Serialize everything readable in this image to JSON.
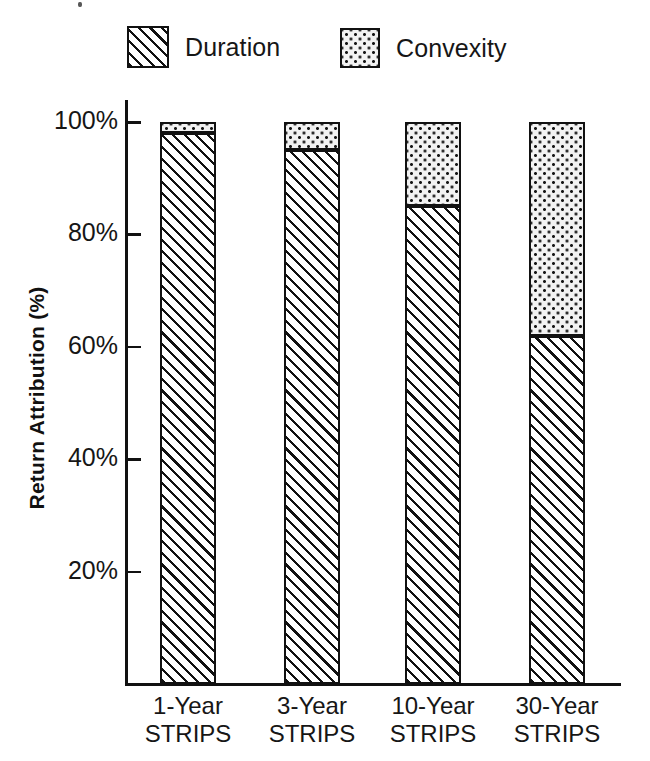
{
  "chart_data": {
    "type": "bar",
    "subtype": "stacked-bar-100",
    "title": "",
    "xlabel": "",
    "ylabel": "Return Attribution (%)",
    "ylim": [
      0,
      105
    ],
    "grid": false,
    "legend_position": "top",
    "categories": [
      "1-Year\nSTRIPS",
      "3-Year\nSTRIPS",
      "10-Year\nSTRIPS",
      "30-Year\nSTRIPS"
    ],
    "category_lines": [
      {
        "line1": "1-Year",
        "line2": "STRIPS"
      },
      {
        "line1": "3-Year",
        "line2": "STRIPS"
      },
      {
        "line1": "10-Year",
        "line2": "STRIPS"
      },
      {
        "line1": "30-Year",
        "line2": "STRIPS"
      }
    ],
    "series": [
      {
        "name": "Duration",
        "pattern": "diagonal-hatch",
        "values": [
          98,
          95,
          85,
          62
        ]
      },
      {
        "name": "Convexity",
        "pattern": "dots",
        "values": [
          2,
          5,
          15,
          38
        ]
      }
    ],
    "yticks": [
      20,
      40,
      60,
      80,
      100
    ],
    "ytick_labels": [
      "20%",
      "40%",
      "60%",
      "80%",
      "100%"
    ]
  },
  "legend": {
    "entries": [
      {
        "label": "Duration"
      },
      {
        "label": "Convexity"
      }
    ]
  },
  "axes": {
    "y_title": "Return Attribution (%)",
    "y_tick_labels": [
      "100%",
      "80%",
      "60%",
      "40%",
      "20%"
    ]
  },
  "colors": {
    "ink": "#111111",
    "paper": "#ffffff",
    "duration_fill": "#ffffff",
    "convexity_fill": "#f2f2f2"
  }
}
